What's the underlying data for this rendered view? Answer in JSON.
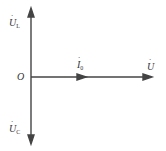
{
  "diagram": {
    "type": "phasor-diagram",
    "origin_label": "O",
    "phasors": [
      {
        "id": "UL",
        "symbol": "U",
        "subscript": "L",
        "direction": "up"
      },
      {
        "id": "UC",
        "symbol": "U",
        "subscript": "C",
        "direction": "down"
      },
      {
        "id": "I0",
        "symbol": "I",
        "subscript": "0",
        "direction": "right"
      },
      {
        "id": "U",
        "symbol": "U",
        "subscript": "",
        "direction": "right"
      }
    ],
    "colors": {
      "line": "#444444",
      "text": "#333333",
      "background": "#ffffff"
    }
  }
}
